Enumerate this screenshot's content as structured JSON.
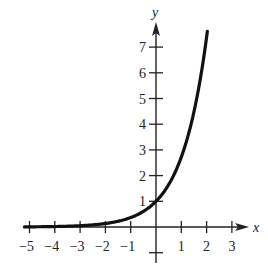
{
  "chart_data": {
    "type": "line",
    "title": "",
    "function": "y = e^x",
    "xlabel": "x",
    "ylabel": "y",
    "xlim": [
      -5.2,
      3.6
    ],
    "ylim": [
      -1.4,
      7.9
    ],
    "grid": false,
    "legend": null,
    "x_ticks": [
      -5,
      -4,
      -3,
      -2,
      -1,
      1,
      2,
      3
    ],
    "x_tick_labels": [
      "−5",
      "−4",
      "−3",
      "−2",
      "−1",
      "1",
      "2",
      "3"
    ],
    "y_ticks": [
      -1,
      1,
      2,
      3,
      4,
      5,
      6,
      7
    ],
    "y_tick_labels": [
      "",
      "1",
      "2",
      "3",
      "4",
      "5",
      "6",
      "7"
    ],
    "series": [
      {
        "name": "exponential curve",
        "x": [
          -5.2,
          -5,
          -4,
          -3,
          -2,
          -1,
          -0.5,
          0,
          0.5,
          1,
          1.25,
          1.5,
          1.75,
          2,
          2.03
        ],
        "y": [
          0.006,
          0.007,
          0.018,
          0.05,
          0.135,
          0.368,
          0.607,
          1.0,
          1.649,
          2.718,
          3.49,
          4.482,
          5.755,
          7.389,
          7.614
        ]
      }
    ]
  },
  "layout": {
    "origin_px": [
      156,
      227
    ],
    "x_unit_px": 25.3,
    "y_unit_px": 25.7,
    "axis_color": "#222222",
    "curve_color": "#111111"
  }
}
